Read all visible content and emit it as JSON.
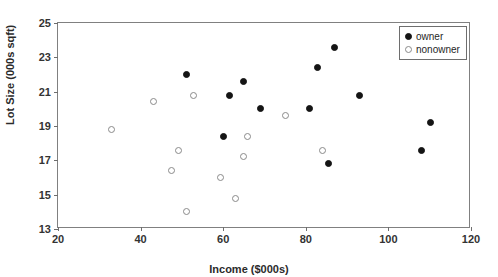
{
  "chart_data": {
    "type": "scatter",
    "title": "",
    "xlabel": "Income ($000s)",
    "ylabel": "Lot Size (000s sqft)",
    "xlim": [
      20,
      120
    ],
    "ylim": [
      13,
      25
    ],
    "xticks": [
      20,
      40,
      60,
      80,
      100,
      120
    ],
    "yticks": [
      13,
      15,
      17,
      19,
      21,
      23,
      25
    ],
    "grid": false,
    "legend_position": "top-right",
    "series": [
      {
        "name": "owner",
        "marker": "filled-circle",
        "color": "#141414",
        "points": [
          {
            "x": 60.0,
            "y": 18.4
          },
          {
            "x": 85.5,
            "y": 16.8
          },
          {
            "x": 64.8,
            "y": 21.6
          },
          {
            "x": 61.5,
            "y": 20.8
          },
          {
            "x": 87.0,
            "y": 23.6
          },
          {
            "x": 110.1,
            "y": 19.2
          },
          {
            "x": 108.0,
            "y": 17.6
          },
          {
            "x": 82.8,
            "y": 22.4
          },
          {
            "x": 69.0,
            "y": 20.0
          },
          {
            "x": 93.0,
            "y": 20.8
          },
          {
            "x": 51.0,
            "y": 22.0
          },
          {
            "x": 81.0,
            "y": 20.0
          }
        ]
      },
      {
        "name": "nonowner",
        "marker": "open-circle",
        "color": "#8a8a8a",
        "points": [
          {
            "x": 75.0,
            "y": 19.6
          },
          {
            "x": 52.8,
            "y": 20.8
          },
          {
            "x": 64.8,
            "y": 17.2
          },
          {
            "x": 43.2,
            "y": 20.4
          },
          {
            "x": 84.0,
            "y": 17.6
          },
          {
            "x": 49.2,
            "y": 17.6
          },
          {
            "x": 59.4,
            "y": 16.0
          },
          {
            "x": 66.0,
            "y": 18.4
          },
          {
            "x": 47.4,
            "y": 16.4
          },
          {
            "x": 33.0,
            "y": 18.8
          },
          {
            "x": 51.0,
            "y": 14.0
          },
          {
            "x": 63.0,
            "y": 14.8
          }
        ]
      }
    ]
  },
  "legend": {
    "items": [
      {
        "label": "owner",
        "marker": "owner"
      },
      {
        "label": "nonowner",
        "marker": "nonowner"
      }
    ]
  }
}
